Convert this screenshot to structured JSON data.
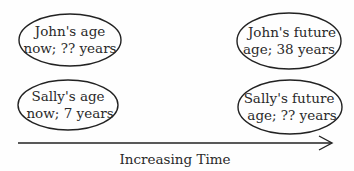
{
  "diagram": {
    "nodes": [
      {
        "id": "john-now",
        "line1": "John's age",
        "line2": "now;  ?? years"
      },
      {
        "id": "john-future",
        "line1": "John's future",
        "line2": "age;  38 years"
      },
      {
        "id": "sally-now",
        "line1": "Sally's age",
        "line2": "now; 7 years"
      },
      {
        "id": "sally-future",
        "line1": "Sally's future",
        "line2": "age; ?? years"
      }
    ],
    "axis": {
      "label": "Increasing Time"
    }
  }
}
